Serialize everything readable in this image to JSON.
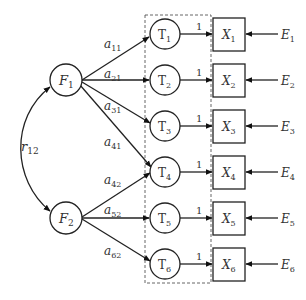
{
  "diagram": {
    "type": "structural-equation-model",
    "factors": [
      {
        "id": "F1",
        "base": "F",
        "sub": "1"
      },
      {
        "id": "F2",
        "base": "F",
        "sub": "2"
      }
    ],
    "correlation": {
      "base": "r",
      "sub": "12",
      "between": [
        "F1",
        "F2"
      ]
    },
    "latent_t": [
      {
        "id": "T1",
        "base": "T",
        "sub": "1"
      },
      {
        "id": "T2",
        "base": "T",
        "sub": "2"
      },
      {
        "id": "T3",
        "base": "T",
        "sub": "3"
      },
      {
        "id": "T4",
        "base": "T",
        "sub": "4"
      },
      {
        "id": "T5",
        "base": "T",
        "sub": "5"
      },
      {
        "id": "T6",
        "base": "T",
        "sub": "6"
      }
    ],
    "observed": [
      {
        "id": "X1",
        "base": "X",
        "sub": "1"
      },
      {
        "id": "X2",
        "base": "X",
        "sub": "2"
      },
      {
        "id": "X3",
        "base": "X",
        "sub": "3"
      },
      {
        "id": "X4",
        "base": "X",
        "sub": "4"
      },
      {
        "id": "X5",
        "base": "X",
        "sub": "5"
      },
      {
        "id": "X6",
        "base": "X",
        "sub": "6"
      }
    ],
    "errors": [
      {
        "id": "E1",
        "base": "E",
        "sub": "1"
      },
      {
        "id": "E2",
        "base": "E",
        "sub": "2"
      },
      {
        "id": "E3",
        "base": "E",
        "sub": "3"
      },
      {
        "id": "E4",
        "base": "E",
        "sub": "4"
      },
      {
        "id": "E5",
        "base": "E",
        "sub": "5"
      },
      {
        "id": "E6",
        "base": "E",
        "sub": "6"
      }
    ],
    "loadings": [
      {
        "from": "F1",
        "to": "T1",
        "base": "a",
        "sub": "11"
      },
      {
        "from": "F1",
        "to": "T2",
        "base": "a",
        "sub": "21"
      },
      {
        "from": "F1",
        "to": "T3",
        "base": "a",
        "sub": "31"
      },
      {
        "from": "F1",
        "to": "T4",
        "base": "a",
        "sub": "41"
      },
      {
        "from": "F2",
        "to": "T4",
        "base": "a",
        "sub": "42"
      },
      {
        "from": "F2",
        "to": "T5",
        "base": "a",
        "sub": "52"
      },
      {
        "from": "F2",
        "to": "T6",
        "base": "a",
        "sub": "62"
      }
    ],
    "t_to_x_weight": "1"
  }
}
